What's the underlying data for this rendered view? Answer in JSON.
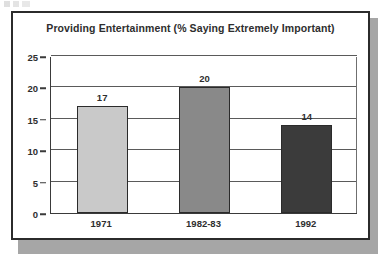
{
  "chart_data": {
    "type": "bar",
    "title": "Providing Entertainment (% Saying Extremely Important)",
    "categories": [
      "1971",
      "1982-83",
      "1992"
    ],
    "values": [
      17,
      20,
      14
    ],
    "value_labels": [
      "17",
      "20",
      "14"
    ],
    "xlabel": "",
    "ylabel": "",
    "ylim": [
      0,
      25
    ],
    "yticks": [
      0,
      5,
      10,
      15,
      20,
      25
    ],
    "ytick_labels": [
      "0",
      "5",
      "10",
      "15",
      "20",
      "25"
    ],
    "grid": true,
    "grid_axis": "y",
    "legend": false,
    "bar_colors": [
      "#c9c9c9",
      "#898989",
      "#3b3b3b"
    ],
    "bar_edge_color": "#2b2b2b",
    "series": [
      {
        "name": "Providing Entertainment",
        "values": [
          17,
          20,
          14
        ]
      }
    ]
  },
  "figure": {
    "frame_border_color": "#2b2b2b",
    "shadow_color": "#a6a6a6",
    "background": "#ffffff"
  }
}
